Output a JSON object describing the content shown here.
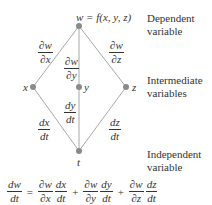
{
  "diagram": {
    "type": "chain-rule-branch-diagram",
    "nodes": {
      "top": {
        "label": "w = f(x, y, z)"
      },
      "x": {
        "label": "x"
      },
      "y": {
        "label": "y"
      },
      "z": {
        "label": "z"
      },
      "t": {
        "label": "t"
      }
    },
    "edge_labels": {
      "w_x": {
        "num": "∂w",
        "den": "∂x"
      },
      "w_y": {
        "num": "∂w",
        "den": "∂y"
      },
      "w_z": {
        "num": "∂w",
        "den": "∂z"
      },
      "x_t": {
        "num": "dx",
        "den": "dt"
      },
      "y_t": {
        "num": "dy",
        "den": "dt"
      },
      "z_t": {
        "num": "dz",
        "den": "dt"
      }
    },
    "side_labels": {
      "dependent": {
        "line1": "Dependent",
        "line2": "variable"
      },
      "intermediate": {
        "line1": "Intermediate",
        "line2": "variables"
      },
      "independent": {
        "line1": "Independent",
        "line2": "variable"
      }
    },
    "equation": {
      "lhs": {
        "num": "dw",
        "den": "dt"
      },
      "equals": "=",
      "plus": "+",
      "terms": [
        {
          "p_num": "∂w",
          "p_den": "∂x",
          "d_num": "dx",
          "d_den": "dt"
        },
        {
          "p_num": "∂w",
          "p_den": "∂y",
          "d_num": "dy",
          "d_den": "dt"
        },
        {
          "p_num": "∂w",
          "p_den": "∂z",
          "d_num": "dz",
          "d_den": "dt"
        }
      ]
    },
    "colors": {
      "line": "#a8a8a8",
      "node": "#8a8a8a",
      "text": "#333333"
    }
  }
}
